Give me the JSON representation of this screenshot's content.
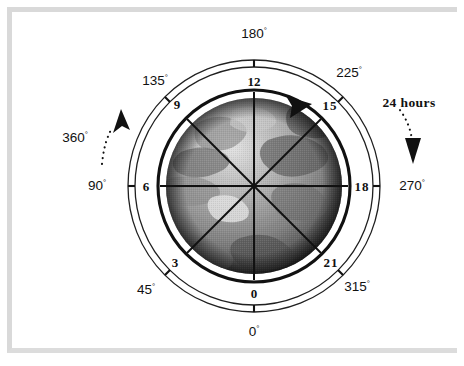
{
  "figure": {
    "type": "polar-diagram",
    "center": {
      "x": 254,
      "y": 186
    },
    "radii": {
      "ring_outer": 126,
      "ring_inner": 119,
      "dial": 96,
      "globe": 88
    }
  },
  "colors": {
    "frame": "#d9d9d9",
    "line": "#111111",
    "ring": "#1a1a1a",
    "background": "#ffffff"
  },
  "annotations": {
    "ccw": {
      "label": "360",
      "degree_mark": "°",
      "name": "360-degrees"
    },
    "cw": {
      "label": "24 hours",
      "name": "24-hours"
    }
  },
  "degree_scale": {
    "unit": "°",
    "ticks": [
      {
        "label": "180",
        "angle": 180,
        "pos": {
          "x": 254,
          "y": 34
        }
      },
      {
        "label": "225",
        "angle": 225,
        "pos": {
          "x": 349,
          "y": 73
        }
      },
      {
        "label": "270",
        "angle": 270,
        "pos": {
          "x": 412,
          "y": 186
        }
      },
      {
        "label": "315",
        "angle": 315,
        "pos": {
          "x": 357,
          "y": 287
        }
      },
      {
        "label": "0",
        "angle": 0,
        "pos": {
          "x": 254,
          "y": 332
        }
      },
      {
        "label": "45",
        "angle": 45,
        "pos": {
          "x": 146,
          "y": 290
        }
      },
      {
        "label": "90",
        "angle": 90,
        "pos": {
          "x": 97,
          "y": 186
        }
      },
      {
        "label": "135",
        "angle": 135,
        "pos": {
          "x": 155,
          "y": 81
        }
      }
    ]
  },
  "hour_scale": {
    "unit": "h",
    "ticks": [
      {
        "label": "12",
        "hour": 12,
        "pos": {
          "x": 254,
          "y": 81
        }
      },
      {
        "label": "15",
        "hour": 15,
        "pos": {
          "x": 330,
          "y": 105
        }
      },
      {
        "label": "18",
        "hour": 18,
        "pos": {
          "x": 362,
          "y": 186
        }
      },
      {
        "label": "21",
        "hour": 21,
        "pos": {
          "x": 331,
          "y": 262
        }
      },
      {
        "label": "0",
        "hour": 0,
        "pos": {
          "x": 254,
          "y": 293
        }
      },
      {
        "label": "3",
        "hour": 3,
        "pos": {
          "x": 175,
          "y": 262
        }
      },
      {
        "label": "6",
        "hour": 6,
        "pos": {
          "x": 146,
          "y": 186
        }
      },
      {
        "label": "9",
        "hour": 9,
        "pos": {
          "x": 177,
          "y": 104
        }
      }
    ]
  },
  "globe": {
    "name": "earth-satellite-image",
    "description": "grayscale satellite view of Earth"
  }
}
